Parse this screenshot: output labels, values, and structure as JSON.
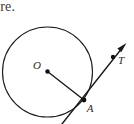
{
  "figure": {
    "caption_fragment": "ure.",
    "background_color": "#ffffff",
    "stroke_color": "#1a1a1a",
    "label_color": "#2b2b2b",
    "circle": {
      "center_label": "O",
      "center_x": 47.5,
      "center_y": 72,
      "radius": 45
    },
    "points": [
      {
        "name": "O",
        "label": "O",
        "x": 47.5,
        "y": 71.5,
        "label_x": 37,
        "label_y": 69,
        "dot": true
      },
      {
        "name": "A",
        "label": "A",
        "x": 84,
        "y": 100,
        "label_x": 88,
        "label_y": 110,
        "dot": true
      },
      {
        "name": "T",
        "label": "T",
        "x": 113,
        "y": 57,
        "label_x": 118,
        "label_y": 64,
        "dot": true
      }
    ],
    "segments": [
      {
        "name": "radius-OA",
        "x1": 47.5,
        "y1": 71.5,
        "x2": 84,
        "y2": 100
      },
      {
        "name": "tangent-ray-AT",
        "x1": 62,
        "y1": 124,
        "x2": 126,
        "y2": 44,
        "arrow": true
      }
    ],
    "arrow_tip": {
      "x": 126,
      "y": 44
    }
  }
}
